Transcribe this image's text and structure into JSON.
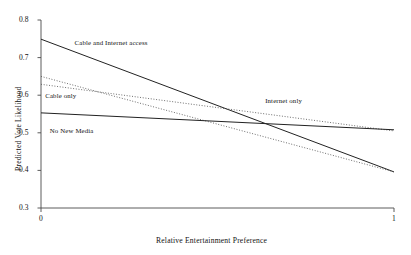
{
  "chart_data": {
    "type": "line",
    "title": "",
    "xlabel": "Relative Entertainment Preference",
    "ylabel": "Predicted Vote Likelihood",
    "xlim": [
      0,
      1
    ],
    "ylim": [
      0.3,
      0.8
    ],
    "xticks": [
      "0",
      "1"
    ],
    "xtick_values": [
      0,
      1
    ],
    "yticks": [
      "0.8",
      "0.7",
      "0.6",
      "0.5",
      "0.4",
      "0.3"
    ],
    "ytick_values": [
      0.8,
      0.7,
      0.6,
      0.5,
      0.4,
      0.3
    ],
    "grid": false,
    "legend_position": "inline-annotations",
    "x": [
      0,
      1
    ],
    "series": [
      {
        "name": "Cable and Internet access",
        "style": "solid",
        "color": "#222222",
        "values": [
          0.749,
          0.396
        ],
        "label_x": 0.095,
        "label_y": 0.738
      },
      {
        "name": "Cable only",
        "style": "dotted",
        "color": "#555555",
        "values": [
          0.65,
          0.396
        ],
        "label_x": 0.012,
        "label_y": 0.597
      },
      {
        "name": "Internet only",
        "style": "dotted",
        "color": "#555555",
        "values": [
          0.629,
          0.505
        ],
        "label_x": 0.635,
        "label_y": 0.585
      },
      {
        "name": "No New Media",
        "style": "solid",
        "color": "#222222",
        "values": [
          0.553,
          0.508
        ],
        "label_x": 0.025,
        "label_y": 0.506
      }
    ]
  },
  "colors": {
    "axis": "#4a4a4a",
    "solid_line": "#222222",
    "dotted_line": "#555555",
    "background": "#ffffff"
  }
}
